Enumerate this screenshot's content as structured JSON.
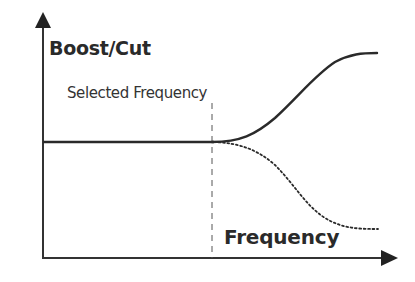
{
  "diagram": {
    "title": "",
    "y_axis_label": "Boost/Cut",
    "x_axis_label": "Frequency",
    "marker_label": "Selected Frequency",
    "colors": {
      "line": "#2a2a2a",
      "axis": "#333333",
      "background": "#ffffff"
    },
    "curves": [
      {
        "name": "boost",
        "style": "solid",
        "description": "flat, then rises above selected frequency"
      },
      {
        "name": "cut",
        "style": "dotted",
        "description": "flat, then falls above selected frequency"
      }
    ],
    "marker": {
      "style": "dashed-vertical"
    }
  }
}
